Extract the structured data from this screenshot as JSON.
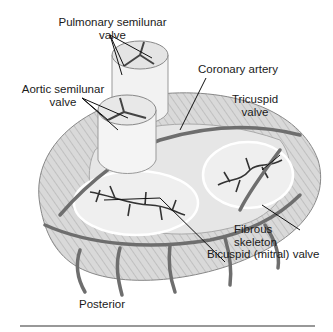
{
  "diagram": {
    "labels": {
      "pulmonary_l1": "Pulmonary semilunar",
      "pulmonary_l2": "valve",
      "coronary": "Coronary artery",
      "aortic_l1": "Aortic semilunar",
      "aortic_l2": "valve",
      "tricuspid_l1": "Tricuspid",
      "tricuspid_l2": "valve",
      "fibrous_l1": "Fibrous",
      "fibrous_l2": "skeleton",
      "bicuspid": "Bicuspid (mitral) valve",
      "orientation": "Posterior"
    },
    "colors": {
      "vessel": "#6e6e6e",
      "muscle": "#cfcfcf",
      "valve_tissue": "#ececec",
      "ink": "#1a1a1a",
      "rule": "#333333"
    }
  }
}
